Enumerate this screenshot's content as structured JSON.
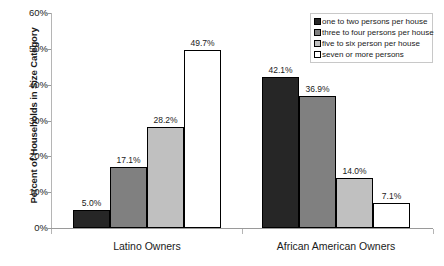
{
  "chart_data": {
    "type": "bar",
    "title": "",
    "xlabel": "",
    "ylabel": "Percent of Households in Size Category",
    "ylim": [
      0,
      60
    ],
    "yticks": [
      "0%",
      "10%",
      "20%",
      "30%",
      "40%",
      "50%",
      "60%"
    ],
    "ytick_values": [
      0,
      10,
      20,
      30,
      40,
      50,
      60
    ],
    "grid": false,
    "legend_position": "top-right",
    "categories": [
      "Latino Owners",
      "African American Owners"
    ],
    "series": [
      {
        "name": "one to two persons per house",
        "color": "#262626",
        "values": [
          5.0,
          42.1
        ],
        "labels": [
          "5.0%",
          "42.1%"
        ]
      },
      {
        "name": "three to four persons per house",
        "color": "#808080",
        "values": [
          17.1,
          36.9
        ],
        "labels": [
          "17.1%",
          "36.9%"
        ]
      },
      {
        "name": "five to six person per house",
        "color": "#c0c0c0",
        "values": [
          28.2,
          14.0
        ],
        "labels": [
          "28.2%",
          "14.0%"
        ]
      },
      {
        "name": "seven or more persons",
        "color": "#ffffff",
        "values": [
          49.7,
          7.1
        ],
        "labels": [
          "49.7%",
          "7.1%"
        ]
      }
    ]
  },
  "legend": {
    "items": [
      {
        "label": "one to two persons per house",
        "color": "#262626"
      },
      {
        "label": "three to four persons per house",
        "color": "#808080"
      },
      {
        "label": "five to six person per house",
        "color": "#c0c0c0"
      },
      {
        "label": "seven or more persons",
        "color": "#ffffff"
      }
    ]
  },
  "axes": {
    "y_title": "Percent of Households in Size Category",
    "y_ticks": [
      "60%",
      "50%",
      "40%",
      "30%",
      "20%",
      "10%",
      "0%"
    ],
    "x_categories": [
      "Latino Owners",
      "African American Owners"
    ]
  }
}
